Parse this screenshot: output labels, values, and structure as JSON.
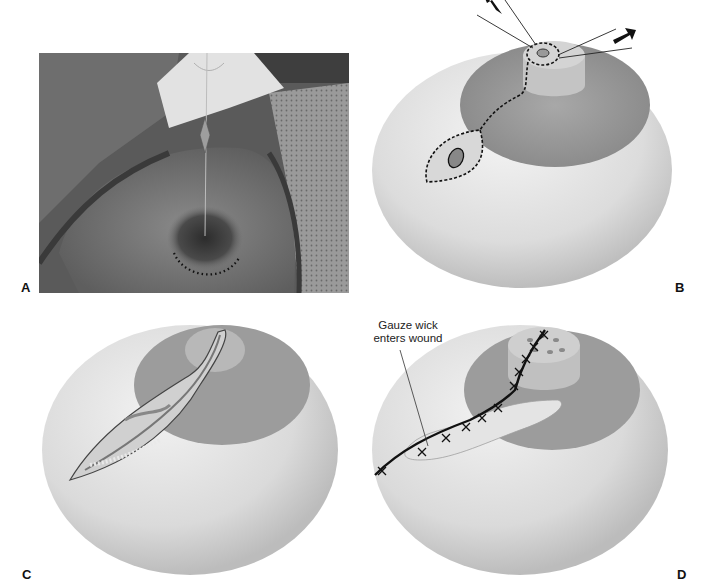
{
  "figure": {
    "panels": [
      {
        "id": "A",
        "label": "A",
        "type": "clinical-photograph"
      },
      {
        "id": "B",
        "label": "B",
        "type": "illustration"
      },
      {
        "id": "C",
        "label": "C",
        "type": "illustration"
      },
      {
        "id": "D",
        "label": "D",
        "type": "illustration"
      }
    ],
    "annotations": {
      "gauze_wick_line1": "Gauze wick",
      "gauze_wick_line2": "enters wound"
    },
    "colors": {
      "background": "#ffffff",
      "skin_light": "#efefef",
      "skin_mid": "#c9c9c9",
      "areola": "#9a9a9a",
      "ink": "#111111",
      "photo_dark": "#4a4a4a",
      "photo_mid": "#7a7a7a"
    }
  }
}
